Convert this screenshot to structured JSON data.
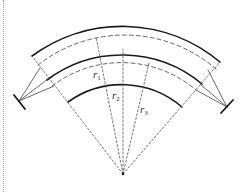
{
  "diagram": {
    "type": "concentric-arc-ring-diagram",
    "center": {
      "x": 123,
      "y": 174
    },
    "labels": {
      "r1": "r",
      "r1_sub": "1",
      "r2": "r",
      "r2_sub": "2",
      "r3": "r",
      "r3_sub": "3"
    },
    "colors": {
      "solid": "#1a1a1a",
      "dashed": "#555555",
      "support": "#444444"
    }
  }
}
